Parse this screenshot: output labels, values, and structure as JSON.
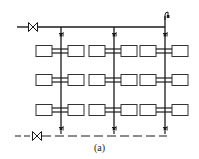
{
  "diagram": {
    "type": "heating-system-piping-schematic",
    "caption": "(a)",
    "colors": {
      "line": "#1a1a1a",
      "radiator_stroke": "#333333",
      "radiator_fill": "#ffffff",
      "background": "#ffffff"
    },
    "supply_main": {
      "style": "solid",
      "y": 27,
      "x_start": 17,
      "x_end": 165,
      "valve_x": 33
    },
    "return_main": {
      "style": "dashed",
      "y": 136,
      "x_start": 15,
      "x_end": 167,
      "valve_x": 37
    },
    "risers": [
      {
        "x": 61,
        "top_y": 27,
        "bottom_y": 136,
        "top_valve_y": 35,
        "bottom_valve_y": 129
      },
      {
        "x": 114,
        "top_y": 27,
        "bottom_y": 136,
        "top_valve_y": 35,
        "bottom_valve_y": 129
      },
      {
        "x": 165,
        "top_y": 16,
        "bottom_y": 136,
        "top_valve_y": 35,
        "bottom_valve_y": 129,
        "air_vent": true
      }
    ],
    "radiator_rows_y": [
      51,
      80,
      110
    ],
    "radiator": {
      "box_width": 16,
      "box_height": 11,
      "gap_from_riser": 7
    }
  }
}
